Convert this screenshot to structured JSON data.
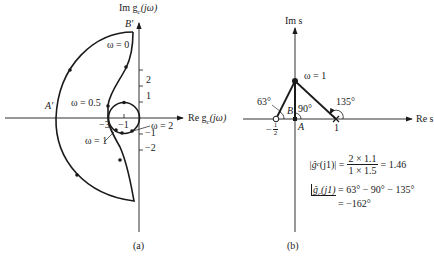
{
  "panel_a": {
    "caption": "(a)",
    "y_axis_label": "Im g",
    "y_axis_sub": "c",
    "y_axis_arg": "(jω)",
    "x_axis_label": "Re g",
    "x_axis_sub": "c",
    "x_axis_arg": "(jω)",
    "point_b_prime": "B′",
    "point_a_prime": "A′",
    "y_ticks": [
      "2",
      "1",
      "−1",
      "−2"
    ],
    "x_ticks": [
      "−3",
      "−1"
    ],
    "annotations": {
      "omega_0": "ω = 0",
      "omega_05": "ω = 0.5",
      "omega_1": "ω = 1",
      "omega_2": "ω = 2"
    }
  },
  "panel_b": {
    "caption": "(b)",
    "y_axis_label": "Im s",
    "x_axis_label": "Re s",
    "omega_label": "ω = 1",
    "angle_zero": "63°",
    "angle_origin": "90°",
    "angle_pole": "135°",
    "point_b": "B",
    "point_a": "A",
    "tick_zero_num": "1",
    "tick_zero_den": "2",
    "tick_zero_sign": "−",
    "tick_pole": "1",
    "magnitude_lhs": "|ĝ",
    "magnitude_lhs_sub": "c",
    "magnitude_lhs_arg": "(j1)| =",
    "magnitude_num": "2 × 1.1",
    "magnitude_den": "1 × 1.5",
    "magnitude_result": "= 1.46",
    "phase_lhs": "ĝ",
    "phase_lhs_sub": "c",
    "phase_lhs_arg": "(j1)",
    "phase_rhs": "= 63° − 90° − 135°",
    "phase_result": "= −162°"
  }
}
